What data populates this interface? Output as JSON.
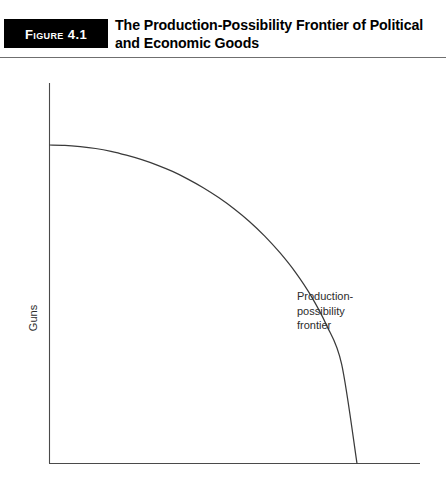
{
  "header": {
    "badge_label": "Figure 4.1",
    "title": "The Production-Possibility Frontier of Political and Economic Goods",
    "badge_color": "#000000",
    "badge_text_color": "#ffffff",
    "rule_color": "#6f6f6f"
  },
  "chart_data": {
    "type": "line",
    "title": "The Production-Possibility Frontier of Political and Economic Goods",
    "xlabel": "Butter",
    "ylabel": "Guns",
    "grid": false,
    "legend": null,
    "axis_color": "#4a4a4a",
    "curve_color": "#3a3a3a",
    "xlim": [
      0,
      1
    ],
    "ylim": [
      0,
      1
    ],
    "axis_ticks": {
      "x": [],
      "y": []
    },
    "annotations": [
      {
        "name": "production-possibility-frontier",
        "lines": [
          "Production-",
          "possibility",
          "frontier"
        ],
        "x": 0.81,
        "y": 0.6
      }
    ],
    "series": [
      {
        "name": "Production-possibility frontier",
        "x": [
          0.0,
          0.05,
          0.1,
          0.15,
          0.2,
          0.25,
          0.3,
          0.35,
          0.4,
          0.45,
          0.5,
          0.55,
          0.6,
          0.65,
          0.7,
          0.75,
          0.8,
          0.85,
          0.9,
          0.95,
          1.0
        ],
        "y": [
          1.0,
          0.999,
          0.995,
          0.989,
          0.98,
          0.968,
          0.954,
          0.937,
          0.917,
          0.893,
          0.866,
          0.835,
          0.8,
          0.76,
          0.714,
          0.661,
          0.6,
          0.527,
          0.436,
          0.312,
          0.0
        ]
      }
    ]
  },
  "labels": {
    "y_axis": "Guns",
    "x_axis": "Butter",
    "annotation_line1": "Production-",
    "annotation_line2": "possibility",
    "annotation_line3": "frontier"
  }
}
